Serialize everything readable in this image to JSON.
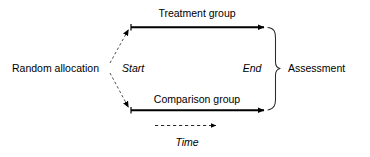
{
  "diagram": {
    "background_color": "#ffffff",
    "line_color": "#000000",
    "labels": {
      "source": "Random allocation",
      "start": "Start",
      "end": "End",
      "treatment_arm": "Treatment group",
      "comparison_arm": "Comparison group",
      "outcome": "Assessment",
      "time_axis": "Time"
    },
    "nodes": [
      {
        "id": "source",
        "label": "Random allocation",
        "x": 58,
        "y": 68,
        "style": "plain-text"
      },
      {
        "id": "start",
        "label": "Start",
        "x": 137,
        "y": 68,
        "style": "italic-text"
      },
      {
        "id": "end",
        "label": "End",
        "x": 252,
        "y": 68,
        "style": "italic-text"
      },
      {
        "id": "treatment",
        "label": "Treatment group",
        "x": 197,
        "y": 13,
        "style": "plain-text"
      },
      {
        "id": "comparison",
        "label": "Comparison group",
        "x": 197,
        "y": 99,
        "style": "plain-text"
      },
      {
        "id": "assessment",
        "label": "Assessment",
        "x": 296,
        "y": 68,
        "style": "plain-text"
      },
      {
        "id": "time",
        "label": "Time",
        "x": 187,
        "y": 142,
        "style": "italic-text"
      }
    ],
    "edges": [
      {
        "id": "allocation-to-treatment",
        "from": "source",
        "to": "treatment-arrow",
        "style": "dashed",
        "arrowhead": true
      },
      {
        "id": "allocation-to-comparison",
        "from": "source",
        "to": "comparison-arrow",
        "style": "dashed",
        "arrowhead": true
      },
      {
        "id": "treatment-arrow",
        "from": "start",
        "to": "end",
        "style": "solid",
        "arrowhead": true,
        "thickness": 2
      },
      {
        "id": "comparison-arrow",
        "from": "start",
        "to": "end",
        "style": "solid",
        "arrowhead": true,
        "thickness": 2
      },
      {
        "id": "time-arrow",
        "from": "start",
        "to": "end",
        "style": "dashed",
        "arrowhead": true,
        "thickness": 1
      }
    ],
    "brace": {
      "id": "assessment-brace",
      "spans": [
        "treatment",
        "comparison"
      ],
      "points_to": "assessment",
      "orientation": "right"
    }
  }
}
